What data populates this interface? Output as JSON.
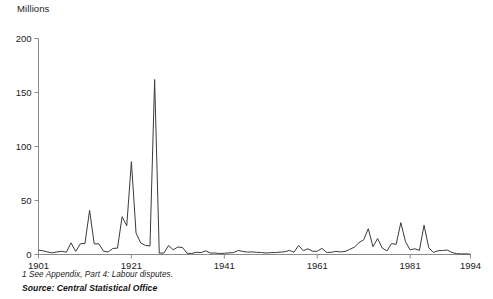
{
  "chart_data": {
    "type": "line",
    "title": "",
    "subtitle": "",
    "ylabel": "Millions",
    "xlabel": "",
    "ylim": [
      0,
      200
    ],
    "xlim": [
      1901,
      1994
    ],
    "grid": false,
    "legend": null,
    "y_ticks": [
      0,
      50,
      100,
      150,
      200
    ],
    "y_tick_labels": [
      "0",
      "50",
      "100",
      "150",
      "200"
    ],
    "x_ticks": [
      1901,
      1921,
      1941,
      1961,
      1981,
      1994
    ],
    "x_tick_labels": [
      "1901",
      "1921",
      "1941",
      "1961",
      "1981",
      "1994"
    ],
    "series": [
      {
        "name": "Working days lost through labour disputes",
        "color": "#3a3a3a",
        "x": [
          1901,
          1902,
          1903,
          1904,
          1905,
          1906,
          1907,
          1908,
          1909,
          1910,
          1911,
          1912,
          1913,
          1914,
          1915,
          1916,
          1917,
          1918,
          1919,
          1920,
          1921,
          1922,
          1923,
          1924,
          1925,
          1926,
          1927,
          1928,
          1929,
          1930,
          1931,
          1932,
          1933,
          1934,
          1935,
          1936,
          1937,
          1938,
          1939,
          1940,
          1941,
          1942,
          1943,
          1944,
          1945,
          1946,
          1947,
          1948,
          1949,
          1950,
          1951,
          1952,
          1953,
          1954,
          1955,
          1956,
          1957,
          1958,
          1959,
          1960,
          1961,
          1962,
          1963,
          1964,
          1965,
          1966,
          1967,
          1968,
          1969,
          1970,
          1971,
          1972,
          1973,
          1974,
          1975,
          1976,
          1977,
          1978,
          1979,
          1980,
          1981,
          1982,
          1983,
          1984,
          1985,
          1986,
          1987,
          1988,
          1989,
          1990,
          1991,
          1992,
          1993,
          1994
        ],
        "values": [
          4.1,
          3.4,
          2.3,
          1.5,
          2.4,
          3.0,
          2.1,
          10.8,
          2.8,
          9.9,
          10.2,
          40.9,
          9.8,
          9.9,
          3.0,
          2.4,
          5.6,
          5.9,
          35.0,
          26.6,
          86.0,
          19.9,
          10.7,
          8.4,
          7.9,
          162.0,
          1.2,
          1.4,
          8.3,
          4.4,
          6.9,
          6.5,
          1.1,
          1.0,
          2.0,
          1.8,
          3.4,
          1.3,
          1.4,
          0.9,
          1.1,
          1.5,
          1.8,
          3.7,
          2.8,
          2.2,
          2.4,
          2.0,
          1.8,
          1.4,
          1.7,
          1.8,
          2.2,
          2.5,
          3.8,
          2.1,
          8.4,
          3.5,
          5.3,
          3.0,
          3.0,
          5.8,
          2.0,
          2.0,
          2.9,
          2.4,
          2.8,
          4.7,
          6.8,
          11.0,
          13.6,
          23.9,
          7.2,
          14.8,
          6.0,
          3.3,
          10.1,
          9.4,
          29.5,
          12.0,
          4.3,
          5.3,
          3.8,
          27.1,
          6.4,
          1.9,
          3.5,
          3.7,
          4.1,
          1.9,
          0.8,
          0.5,
          0.6,
          0.3
        ]
      }
    ],
    "annotations": []
  },
  "footnote": "1 See Appendix, Part 4: Labour disputes.",
  "source": "Source: Central Statistical Office"
}
